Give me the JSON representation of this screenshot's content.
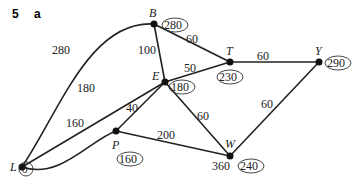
{
  "question": {
    "number": "5",
    "part": "a"
  },
  "nodes": [
    {
      "id": "L",
      "label": "L",
      "final": "0"
    },
    {
      "id": "B",
      "label": "B",
      "final": "280"
    },
    {
      "id": "E",
      "label": "E",
      "final": "180"
    },
    {
      "id": "T",
      "label": "T",
      "final": "230"
    },
    {
      "id": "Y",
      "label": "Y",
      "final": "290"
    },
    {
      "id": "P",
      "label": "P",
      "final": "160"
    },
    {
      "id": "W",
      "label": "W",
      "final": "240",
      "temp": "360"
    }
  ],
  "edges": [
    {
      "from": "L",
      "to": "B",
      "weight": "280"
    },
    {
      "from": "L",
      "to": "E",
      "weight": "180"
    },
    {
      "from": "L",
      "to": "P",
      "weight": "160"
    },
    {
      "from": "B",
      "to": "E",
      "weight": "100"
    },
    {
      "from": "B",
      "to": "T",
      "weight": "60"
    },
    {
      "from": "E",
      "to": "T",
      "weight": "50"
    },
    {
      "from": "E",
      "to": "P",
      "weight": "40"
    },
    {
      "from": "E",
      "to": "W",
      "weight": "60"
    },
    {
      "from": "T",
      "to": "Y",
      "weight": "60"
    },
    {
      "from": "P",
      "to": "W",
      "weight": "200"
    },
    {
      "from": "Y",
      "to": "W",
      "weight": "60"
    }
  ]
}
